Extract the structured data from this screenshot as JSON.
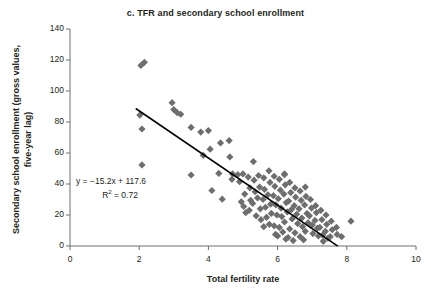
{
  "chart_data": {
    "type": "scatter",
    "title": "c. TFR and secondary school enrollment",
    "xlabel": "Total fertility rate",
    "ylabel": "Secondary school enrollment (gross values, five-year lag)",
    "xlim": [
      0,
      10
    ],
    "ylim": [
      0,
      140
    ],
    "xticks": [
      0,
      2,
      4,
      6,
      8,
      10
    ],
    "yticks": [
      0,
      20,
      40,
      60,
      80,
      100,
      120,
      140
    ],
    "xtick_labels": [
      "0",
      "2",
      "4",
      "6",
      "8",
      "10"
    ],
    "ytick_labels": [
      "0",
      "20",
      "40",
      "60",
      "80",
      "100",
      "120",
      "140"
    ],
    "grid": false,
    "legend": null,
    "marker": "diamond",
    "marker_color": "#6e6e6e",
    "trendline": {
      "equation_label": "y = −15.2x + 117.6",
      "r2_label": "R",
      "r2_sup": "2",
      "r2_value_label": " = 0.72",
      "slope": -15.2,
      "intercept": 117.6,
      "r2": 0.72,
      "color": "#000000",
      "x_start": 1.9,
      "x_end": 7.74
    },
    "points": [
      [
        2.05,
        116.5
      ],
      [
        2.15,
        118.5
      ],
      [
        2.02,
        84.5
      ],
      [
        2.08,
        75.5
      ],
      [
        2.08,
        52.3
      ],
      [
        2.95,
        92.5
      ],
      [
        3.0,
        88.0
      ],
      [
        3.1,
        86.0
      ],
      [
        3.2,
        85.0
      ],
      [
        3.5,
        76.5
      ],
      [
        3.5,
        45.8
      ],
      [
        3.78,
        73.5
      ],
      [
        3.85,
        58.5
      ],
      [
        4.0,
        74.5
      ],
      [
        4.05,
        62.5
      ],
      [
        4.1,
        35.8
      ],
      [
        4.35,
        66.5
      ],
      [
        4.3,
        46.8
      ],
      [
        4.4,
        30.2
      ],
      [
        4.6,
        68.0
      ],
      [
        4.62,
        57.5
      ],
      [
        4.7,
        46.5
      ],
      [
        4.68,
        43.0
      ],
      [
        4.85,
        46.0
      ],
      [
        4.9,
        41.5
      ],
      [
        4.95,
        28.5
      ],
      [
        5.0,
        46.5
      ],
      [
        5.05,
        33.5
      ],
      [
        5.02,
        25.5
      ],
      [
        5.08,
        21.5
      ],
      [
        5.15,
        44.5
      ],
      [
        5.2,
        37.5
      ],
      [
        5.22,
        29.5
      ],
      [
        5.18,
        23.0
      ],
      [
        5.3,
        54.5
      ],
      [
        5.32,
        42.5
      ],
      [
        5.35,
        35.0
      ],
      [
        5.28,
        27.5
      ],
      [
        5.38,
        19.5
      ],
      [
        5.45,
        45.5
      ],
      [
        5.48,
        38.0
      ],
      [
        5.42,
        31.0
      ],
      [
        5.5,
        24.0
      ],
      [
        5.52,
        17.0
      ],
      [
        5.6,
        44.0
      ],
      [
        5.62,
        36.5
      ],
      [
        5.58,
        30.0
      ],
      [
        5.65,
        25.0
      ],
      [
        5.68,
        18.5
      ],
      [
        5.6,
        12.5
      ],
      [
        5.75,
        48.5
      ],
      [
        5.78,
        41.0
      ],
      [
        5.72,
        33.0
      ],
      [
        5.8,
        27.0
      ],
      [
        5.82,
        21.0
      ],
      [
        5.76,
        14.0
      ],
      [
        5.9,
        45.0
      ],
      [
        5.92,
        38.5
      ],
      [
        5.88,
        32.5
      ],
      [
        5.95,
        26.5
      ],
      [
        5.98,
        20.0
      ],
      [
        5.9,
        13.0
      ],
      [
        5.94,
        7.5
      ],
      [
        6.05,
        43.0
      ],
      [
        6.08,
        36.0
      ],
      [
        6.02,
        30.5
      ],
      [
        6.1,
        24.5
      ],
      [
        6.12,
        19.0
      ],
      [
        6.05,
        12.0
      ],
      [
        6.0,
        6.5
      ],
      [
        6.2,
        46.5
      ],
      [
        6.22,
        39.5
      ],
      [
        6.18,
        33.5
      ],
      [
        6.25,
        28.0
      ],
      [
        6.28,
        22.0
      ],
      [
        6.2,
        15.5
      ],
      [
        6.15,
        9.0
      ],
      [
        6.24,
        4.5
      ],
      [
        6.35,
        41.0
      ],
      [
        6.38,
        34.5
      ],
      [
        6.32,
        29.0
      ],
      [
        6.4,
        23.5
      ],
      [
        6.42,
        17.5
      ],
      [
        6.35,
        11.0
      ],
      [
        6.3,
        5.5
      ],
      [
        6.5,
        37.5
      ],
      [
        6.52,
        31.5
      ],
      [
        6.48,
        26.0
      ],
      [
        6.55,
        20.5
      ],
      [
        6.58,
        14.5
      ],
      [
        6.5,
        8.5
      ],
      [
        6.45,
        3.5
      ],
      [
        6.65,
        35.5
      ],
      [
        6.68,
        29.5
      ],
      [
        6.62,
        24.0
      ],
      [
        6.7,
        18.0
      ],
      [
        6.72,
        12.5
      ],
      [
        6.65,
        6.0
      ],
      [
        6.8,
        38.0
      ],
      [
        6.82,
        32.0
      ],
      [
        6.78,
        26.5
      ],
      [
        6.85,
        21.0
      ],
      [
        6.88,
        15.0
      ],
      [
        6.8,
        9.5
      ],
      [
        6.75,
        4.0
      ],
      [
        6.95,
        30.0
      ],
      [
        6.98,
        24.5
      ],
      [
        6.92,
        19.5
      ],
      [
        7.0,
        13.5
      ],
      [
        7.02,
        8.0
      ],
      [
        7.1,
        26.0
      ],
      [
        7.12,
        21.5
      ],
      [
        7.08,
        16.5
      ],
      [
        7.15,
        11.5
      ],
      [
        7.18,
        6.5
      ],
      [
        7.25,
        23.0
      ],
      [
        7.28,
        17.0
      ],
      [
        7.22,
        12.0
      ],
      [
        7.3,
        7.0
      ],
      [
        7.32,
        3.0
      ],
      [
        7.4,
        20.0
      ],
      [
        7.42,
        14.0
      ],
      [
        7.38,
        9.5
      ],
      [
        7.45,
        5.0
      ],
      [
        7.55,
        16.0
      ],
      [
        7.58,
        10.5
      ],
      [
        7.52,
        6.0
      ],
      [
        7.7,
        12.0
      ],
      [
        7.72,
        7.5
      ],
      [
        7.85,
        6.0
      ],
      [
        6.2,
        46.0
      ],
      [
        8.12,
        16.0
      ]
    ]
  },
  "annotations": {
    "equation_text": "y = −15.2x + 117.6",
    "r2_prefix": "R",
    "r2_superscript": "2",
    "r2_suffix": " = 0.72"
  }
}
